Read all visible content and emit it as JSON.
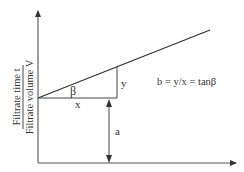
{
  "diagram": {
    "y_axis_label": {
      "numerator": "Filtrate time t",
      "denominator": "Filtrate volume V"
    },
    "labels": {
      "beta": "β",
      "x": "x",
      "y": "y",
      "a": "a"
    },
    "equation": "b = y/x = tanβ",
    "colors": {
      "line": "#333333",
      "axis": "#444444",
      "text": "#333333"
    }
  }
}
